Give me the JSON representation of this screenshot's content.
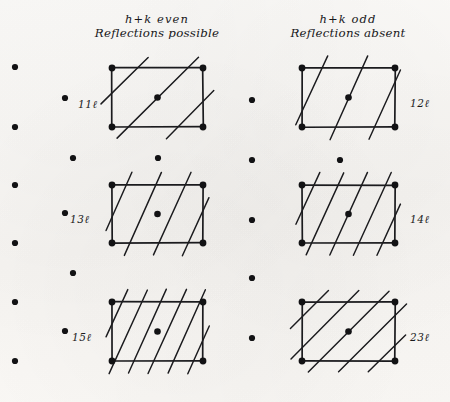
{
  "figure": {
    "title_left": {
      "line1": "h+k even",
      "line2": "Reflections possible"
    },
    "title_right": {
      "line1": "h+k odd",
      "line2": "Reflections absent"
    },
    "ink_color": "#1b1b1e",
    "paper_color": "#fbfaf8",
    "dot_color": "#121214",
    "labels": [
      {
        "text": "11ℓ",
        "x": 78,
        "y": 98
      },
      {
        "text": "12ℓ",
        "x": 410,
        "y": 97
      },
      {
        "text": "13ℓ",
        "x": 70,
        "y": 213
      },
      {
        "text": "14ℓ",
        "x": 410,
        "y": 213
      },
      {
        "text": "15ℓ",
        "x": 72,
        "y": 331
      },
      {
        "text": "23ℓ",
        "x": 410,
        "y": 331
      }
    ],
    "lattice_dots": [
      {
        "x": 15,
        "y": 67
      },
      {
        "x": 15,
        "y": 127
      },
      {
        "x": 15,
        "y": 185
      },
      {
        "x": 15,
        "y": 243
      },
      {
        "x": 15,
        "y": 302
      },
      {
        "x": 15,
        "y": 361
      },
      {
        "x": 65,
        "y": 98
      },
      {
        "x": 65,
        "y": 213
      },
      {
        "x": 65,
        "y": 331
      },
      {
        "x": 73,
        "y": 158
      },
      {
        "x": 73,
        "y": 273
      },
      {
        "x": 158,
        "y": 158
      },
      {
        "x": 252,
        "y": 100
      },
      {
        "x": 252,
        "y": 160
      },
      {
        "x": 252,
        "y": 220
      },
      {
        "x": 252,
        "y": 278
      },
      {
        "x": 252,
        "y": 338
      },
      {
        "x": 340,
        "y": 160
      }
    ],
    "cells": [
      {
        "name": "cell-11l",
        "index": "11ℓ",
        "x0": 112,
        "y0": 68,
        "x1": 203,
        "y1": 127,
        "hatch_slope": "shallow",
        "hatch_count": 3,
        "corner_dots": true,
        "center_dot": true
      },
      {
        "name": "cell-12l",
        "index": "12ℓ",
        "x0": 302,
        "y0": 68,
        "x1": 395,
        "y1": 127,
        "hatch_slope": "steep",
        "hatch_count": 3,
        "corner_dots": true,
        "center_dot": true
      },
      {
        "name": "cell-13l",
        "index": "13ℓ",
        "x0": 112,
        "y0": 185,
        "x1": 203,
        "y1": 243,
        "hatch_slope": "steep",
        "hatch_count": 4,
        "corner_dots": true,
        "center_dot": true
      },
      {
        "name": "cell-14l",
        "index": "14ℓ",
        "x0": 302,
        "y0": 185,
        "x1": 395,
        "y1": 243,
        "hatch_slope": "steep",
        "hatch_count": 5,
        "corner_dots": true,
        "center_dot": true
      },
      {
        "name": "cell-15l",
        "index": "15ℓ",
        "x0": 112,
        "y0": 302,
        "x1": 203,
        "y1": 361,
        "hatch_slope": "steep",
        "hatch_count": 6,
        "corner_dots": true,
        "center_dot": true
      },
      {
        "name": "cell-23l",
        "index": "23ℓ",
        "x0": 302,
        "y0": 302,
        "x1": 395,
        "y1": 361,
        "hatch_slope": "shallow",
        "hatch_count": 5,
        "corner_dots": true,
        "center_dot": true
      }
    ],
    "header_positions": {
      "left": {
        "x": 157,
        "y": 12
      },
      "right": {
        "x": 348,
        "y": 12
      }
    }
  }
}
